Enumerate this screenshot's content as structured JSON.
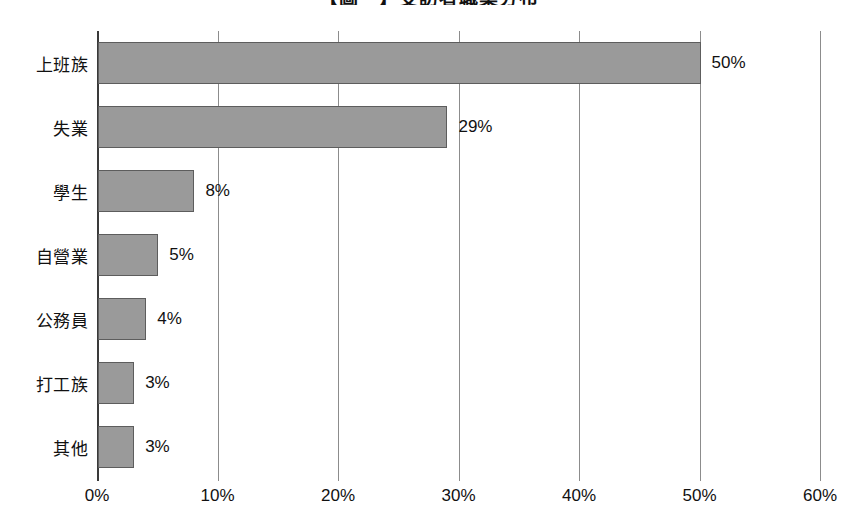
{
  "chart_data": {
    "type": "bar",
    "orientation": "horizontal",
    "title": "【圖一】受訪者職業分布",
    "xlabel": "",
    "ylabel": "",
    "categories": [
      "上班族",
      "失業",
      "學生",
      "自營業",
      "公務員",
      "打工族",
      "其他"
    ],
    "values": [
      50,
      29,
      8,
      5,
      4,
      3,
      3
    ],
    "value_labels": [
      "50%",
      "29%",
      "8%",
      "5%",
      "4%",
      "3%",
      "3%"
    ],
    "xlim": [
      0,
      60
    ],
    "xticks": [
      0,
      10,
      20,
      30,
      40,
      50,
      60
    ],
    "xtick_labels": [
      "0%",
      "10%",
      "20%",
      "30%",
      "40%",
      "50%",
      "60%"
    ],
    "grid": "vertical",
    "legend": null,
    "bar_fill": "#9a9a9a",
    "bar_border": "#5d5d5d",
    "gridline_color": "#8c8c8c",
    "axis_color": "#3a3a3a",
    "background": "#ffffff"
  }
}
